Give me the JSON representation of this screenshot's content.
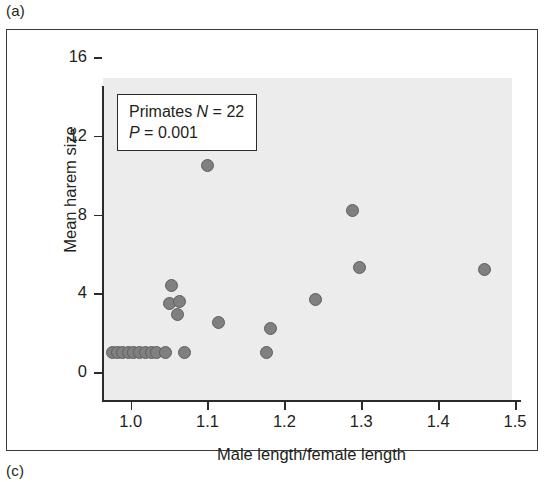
{
  "panel_labels": {
    "top": "(a)",
    "bottom": "(c)"
  },
  "annotation": {
    "line1_prefix": "Primates ",
    "line1_italic": "N",
    "line1_suffix": " = 22",
    "line2_italic": "P",
    "line2_suffix": " = 0.001"
  },
  "colors": {
    "panel_background": "#ececec",
    "marker_fill": "#808080",
    "marker_edge": "#5e5e5e",
    "axis": "#2b2b2b",
    "text": "#231f20",
    "frame": "#3a3a3a"
  },
  "chart_data": {
    "type": "scatter",
    "title": "",
    "xlabel": "Male length/female length",
    "ylabel": "Mean harem size",
    "xlim": [
      0.955,
      1.5
    ],
    "ylim": [
      0,
      16
    ],
    "xticks": [
      1.0,
      1.1,
      1.2,
      1.3,
      1.4,
      1.5
    ],
    "xticklabels": [
      "1.0",
      "1.1",
      "1.2",
      "1.3",
      "1.4",
      "1.5"
    ],
    "yticks": [
      0,
      4,
      8,
      12,
      16
    ],
    "yticklabels": [
      "0",
      "4",
      "8",
      "12",
      "16"
    ],
    "grid": false,
    "legend": null,
    "annotations": [
      "Primates N = 22",
      "P = 0.001"
    ],
    "n_points": 22,
    "series": [
      {
        "name": "Primates",
        "points": [
          {
            "x": 0.977,
            "y": 1.0
          },
          {
            "x": 0.983,
            "y": 1.0
          },
          {
            "x": 0.99,
            "y": 1.0
          },
          {
            "x": 0.997,
            "y": 1.0
          },
          {
            "x": 1.004,
            "y": 1.0
          },
          {
            "x": 1.011,
            "y": 1.0
          },
          {
            "x": 1.02,
            "y": 1.0
          },
          {
            "x": 1.027,
            "y": 1.0
          },
          {
            "x": 1.034,
            "y": 1.0
          },
          {
            "x": 1.046,
            "y": 1.0
          },
          {
            "x": 1.07,
            "y": 1.0
          },
          {
            "x": 1.053,
            "y": 4.4
          },
          {
            "x": 1.05,
            "y": 3.5
          },
          {
            "x": 1.064,
            "y": 3.6
          },
          {
            "x": 1.061,
            "y": 2.9
          },
          {
            "x": 1.1,
            "y": 10.5
          },
          {
            "x": 1.114,
            "y": 2.5
          },
          {
            "x": 1.177,
            "y": 1.0
          },
          {
            "x": 1.182,
            "y": 2.2
          },
          {
            "x": 1.24,
            "y": 3.7
          },
          {
            "x": 1.288,
            "y": 8.2
          },
          {
            "x": 1.298,
            "y": 5.3
          },
          {
            "x": 1.46,
            "y": 5.2
          }
        ]
      }
    ]
  }
}
